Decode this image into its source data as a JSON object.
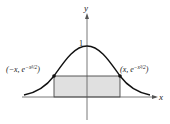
{
  "figure": {
    "axis_x_label": "x",
    "axis_y_label": "y",
    "peak_label": "1",
    "left_point": {
      "prefix": "(−x, e",
      "exponent": "−x²/2",
      "suffix": ")"
    },
    "right_point": {
      "prefix": "(x, e",
      "exponent": "−x²/2",
      "suffix": ")"
    },
    "curve": "y = e^(-x^2/2)",
    "rectangle_fill": "#e0e0e0",
    "stroke_color": "#111111"
  }
}
